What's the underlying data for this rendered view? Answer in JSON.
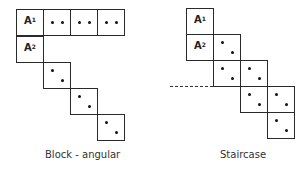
{
  "diagrams": [
    {
      "name": "block-angular",
      "caption": "Block - angular",
      "caption_pos": [
        45,
        149
      ],
      "cells": [
        {
          "x": 16,
          "y": 9,
          "label": "A",
          "sup": "1"
        },
        {
          "x": 43,
          "y": 9,
          "dots": "row"
        },
        {
          "x": 70,
          "y": 9,
          "dots": "row"
        },
        {
          "x": 97,
          "y": 9,
          "dots": "row"
        },
        {
          "x": 16,
          "y": 36,
          "label": "A",
          "sup": "2"
        },
        {
          "x": 43,
          "y": 62,
          "dots": "diag"
        },
        {
          "x": 70,
          "y": 88,
          "dots": "diag"
        },
        {
          "x": 97,
          "y": 114,
          "dots": "diag"
        }
      ]
    },
    {
      "name": "staircase",
      "caption": "Staircase",
      "caption_pos": [
        220,
        149
      ],
      "dashed_line": {
        "x": 170,
        "y": 86,
        "width": 43
      },
      "cells": [
        {
          "x": 186,
          "y": 8,
          "label": "A",
          "sup": "1"
        },
        {
          "x": 186,
          "y": 34,
          "label": "A",
          "sup": "2"
        },
        {
          "x": 213,
          "y": 34,
          "dots": "diag"
        },
        {
          "x": 213,
          "y": 60,
          "dots": "diag"
        },
        {
          "x": 240,
          "y": 60,
          "dots": "diag"
        },
        {
          "x": 240,
          "y": 86,
          "dots": "diag"
        },
        {
          "x": 267,
          "y": 86,
          "dots": "diag"
        },
        {
          "x": 267,
          "y": 112,
          "dots": "diag"
        }
      ]
    }
  ]
}
